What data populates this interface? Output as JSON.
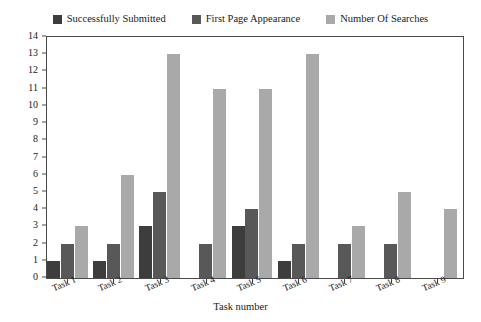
{
  "chart_data": {
    "type": "bar",
    "title": "",
    "subtitle": "",
    "xlabel": "Task number",
    "ylabel": "Count",
    "categories": [
      "Task 1",
      "Task 2",
      "Task 3",
      "Task 4",
      "Task 5",
      "Task 6",
      "Task 7",
      "Task 8",
      "Task 9"
    ],
    "series": [
      {
        "name": "Successfully Submitted",
        "color": "#3d3d3d",
        "values": [
          1,
          1,
          3,
          0,
          3,
          1,
          0,
          0,
          0
        ]
      },
      {
        "name": "First Page Appearance",
        "color": "#585858",
        "values": [
          2,
          2,
          5,
          2,
          4,
          2,
          2,
          2,
          0
        ]
      },
      {
        "name": "Number Of Searches",
        "color": "#a9a9a9",
        "values": [
          3,
          6,
          13,
          11,
          11,
          13,
          3,
          5,
          4
        ]
      }
    ],
    "ylim": [
      0,
      14
    ],
    "ytick_step": 1,
    "yticks": [
      0,
      1,
      2,
      3,
      4,
      5,
      6,
      7,
      8,
      9,
      10,
      11,
      12,
      13,
      14
    ],
    "grid": false,
    "legend_position": "top",
    "axis_color": "#4a4a4a",
    "text_color": "#1a1a1a",
    "background": "#ffffff"
  }
}
